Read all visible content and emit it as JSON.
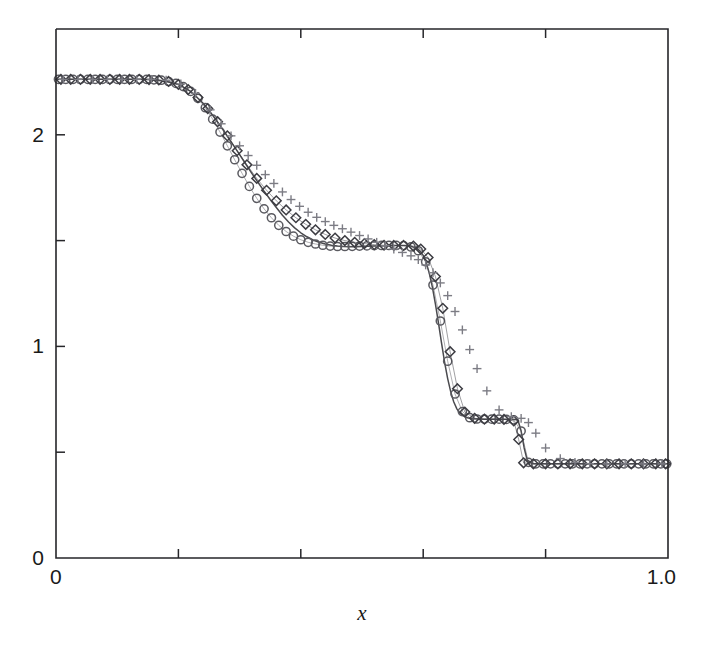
{
  "figure": {
    "background": "#ffffff",
    "width": 711,
    "height": 660
  },
  "axes": {
    "plot_box": {
      "left": 56,
      "right": 668,
      "top": 29,
      "bottom": 558
    },
    "xlabel": "x",
    "ylabel": "",
    "x_ticklabels": [
      {
        "value": 0.0,
        "text": "0"
      },
      {
        "value": 1.0,
        "text": "1.0"
      }
    ],
    "y_ticklabels": [
      {
        "value": 0,
        "text": "0"
      },
      {
        "value": 1,
        "text": "1"
      },
      {
        "value": 2,
        "text": "2"
      }
    ],
    "x_minor_ticks": [
      0.2,
      0.4,
      0.6,
      0.8
    ],
    "y_minor_ticks": [
      0.5,
      1.5
    ],
    "tick_direction": "in",
    "grid": false,
    "frame_color": "#26262a"
  },
  "chart_data": {
    "type": "line",
    "title": "",
    "subtitle": "",
    "xlabel": "x",
    "ylabel": "",
    "xlim": [
      0.0,
      1.0
    ],
    "ylim": [
      0.0,
      2.5
    ],
    "grid": false,
    "legend": "none",
    "annotations": [],
    "colors": {
      "reference_line": "#4a4a4e",
      "circle_marker": "#5a5a60",
      "diamond_marker": "#3c3c42",
      "plus_marker": "#7c7c84"
    },
    "series": [
      {
        "name": "exact-solution",
        "style": "solid-line",
        "marker": "none",
        "color": "#4a4a4e",
        "x": [
          0.0,
          0.02,
          0.04,
          0.06,
          0.08,
          0.1,
          0.12,
          0.14,
          0.16,
          0.18,
          0.2,
          0.22,
          0.24,
          0.25,
          0.26,
          0.27,
          0.28,
          0.29,
          0.3,
          0.31,
          0.32,
          0.33,
          0.34,
          0.35,
          0.36,
          0.37,
          0.38,
          0.39,
          0.4,
          0.41,
          0.42,
          0.43,
          0.44,
          0.45,
          0.46,
          0.47,
          0.48,
          0.49,
          0.5,
          0.51,
          0.52,
          0.53,
          0.54,
          0.55,
          0.56,
          0.57,
          0.58,
          0.59,
          0.595,
          0.6,
          0.605,
          0.61,
          0.615,
          0.62,
          0.625,
          0.63,
          0.635,
          0.64,
          0.645,
          0.65,
          0.655,
          0.66,
          0.67,
          0.68,
          0.7,
          0.72,
          0.735,
          0.745,
          0.75,
          0.755,
          0.76,
          0.765,
          0.77,
          0.78,
          0.8,
          0.84,
          0.88,
          0.92,
          0.96,
          1.0
        ],
        "y": [
          2.262,
          2.262,
          2.262,
          2.262,
          2.262,
          2.262,
          2.262,
          2.262,
          2.26,
          2.252,
          2.238,
          2.205,
          2.15,
          2.115,
          2.077,
          2.036,
          1.993,
          1.95,
          1.906,
          1.862,
          1.818,
          1.776,
          1.734,
          1.694,
          1.656,
          1.62,
          1.588,
          1.56,
          1.537,
          1.518,
          1.503,
          1.492,
          1.484,
          1.478,
          1.474,
          1.472,
          1.471,
          1.471,
          1.472,
          1.473,
          1.474,
          1.475,
          1.476,
          1.477,
          1.477,
          1.477,
          1.474,
          1.462,
          1.45,
          1.43,
          1.395,
          1.345,
          1.28,
          1.2,
          1.11,
          1.015,
          0.925,
          0.848,
          0.785,
          0.737,
          0.705,
          0.684,
          0.664,
          0.658,
          0.656,
          0.656,
          0.656,
          0.656,
          0.655,
          0.65,
          0.6,
          0.52,
          0.462,
          0.446,
          0.445,
          0.445,
          0.445,
          0.445,
          0.445,
          0.445
        ]
      },
      {
        "name": "scheme-A-circles",
        "style": "markers",
        "marker": "circle",
        "color": "#5a5a60",
        "x": [
          0.004,
          0.016,
          0.028,
          0.04,
          0.052,
          0.064,
          0.076,
          0.088,
          0.1,
          0.112,
          0.124,
          0.136,
          0.148,
          0.16,
          0.172,
          0.184,
          0.196,
          0.208,
          0.22,
          0.232,
          0.244,
          0.256,
          0.268,
          0.28,
          0.292,
          0.304,
          0.316,
          0.328,
          0.34,
          0.352,
          0.364,
          0.376,
          0.388,
          0.4,
          0.412,
          0.424,
          0.436,
          0.448,
          0.46,
          0.472,
          0.484,
          0.496,
          0.508,
          0.52,
          0.532,
          0.544,
          0.556,
          0.568,
          0.58,
          0.592,
          0.604,
          0.616,
          0.628,
          0.64,
          0.652,
          0.664,
          0.676,
          0.688,
          0.7,
          0.712,
          0.724,
          0.736,
          0.748,
          0.76,
          0.772,
          0.784,
          0.796,
          0.808,
          0.82,
          0.832,
          0.844,
          0.856,
          0.868,
          0.88,
          0.892,
          0.904,
          0.916,
          0.928,
          0.94,
          0.952,
          0.964,
          0.976,
          0.988,
          0.998
        ],
        "y": [
          2.262,
          2.262,
          2.262,
          2.262,
          2.262,
          2.262,
          2.262,
          2.262,
          2.262,
          2.262,
          2.262,
          2.262,
          2.262,
          2.26,
          2.258,
          2.252,
          2.243,
          2.228,
          2.205,
          2.172,
          2.128,
          2.074,
          2.013,
          1.948,
          1.882,
          1.818,
          1.756,
          1.7,
          1.65,
          1.608,
          1.572,
          1.543,
          1.521,
          1.504,
          1.492,
          1.484,
          1.478,
          1.474,
          1.472,
          1.472,
          1.473,
          1.474,
          1.475,
          1.476,
          1.477,
          1.477,
          1.477,
          1.476,
          1.47,
          1.452,
          1.4,
          1.29,
          1.12,
          0.93,
          0.775,
          0.692,
          0.663,
          0.657,
          0.656,
          0.656,
          0.656,
          0.655,
          0.653,
          0.6,
          0.452,
          0.445,
          0.445,
          0.445,
          0.445,
          0.445,
          0.445,
          0.445,
          0.445,
          0.445,
          0.445,
          0.445,
          0.445,
          0.445,
          0.445,
          0.445,
          0.445,
          0.445,
          0.445,
          0.445
        ]
      },
      {
        "name": "scheme-B-diamonds",
        "style": "markers",
        "marker": "diamond",
        "color": "#3c3c42",
        "x": [
          0.008,
          0.024,
          0.04,
          0.056,
          0.072,
          0.088,
          0.104,
          0.12,
          0.136,
          0.152,
          0.168,
          0.184,
          0.2,
          0.216,
          0.232,
          0.248,
          0.264,
          0.28,
          0.296,
          0.312,
          0.328,
          0.344,
          0.36,
          0.376,
          0.392,
          0.408,
          0.424,
          0.44,
          0.456,
          0.472,
          0.488,
          0.504,
          0.52,
          0.536,
          0.552,
          0.568,
          0.584,
          0.596,
          0.608,
          0.62,
          0.632,
          0.644,
          0.656,
          0.668,
          0.684,
          0.7,
          0.716,
          0.732,
          0.748,
          0.756,
          0.764,
          0.78,
          0.8,
          0.82,
          0.84,
          0.86,
          0.88,
          0.9,
          0.92,
          0.94,
          0.96,
          0.98,
          0.996
        ],
        "y": [
          2.262,
          2.262,
          2.262,
          2.262,
          2.262,
          2.262,
          2.262,
          2.262,
          2.262,
          2.261,
          2.259,
          2.252,
          2.238,
          2.214,
          2.176,
          2.124,
          2.062,
          1.995,
          1.925,
          1.858,
          1.794,
          1.738,
          1.688,
          1.645,
          1.608,
          1.577,
          1.551,
          1.529,
          1.512,
          1.5,
          1.492,
          1.486,
          1.481,
          1.478,
          1.477,
          1.477,
          1.474,
          1.46,
          1.42,
          1.33,
          1.18,
          0.975,
          0.8,
          0.69,
          0.66,
          0.656,
          0.656,
          0.655,
          0.648,
          0.56,
          0.45,
          0.445,
          0.445,
          0.445,
          0.445,
          0.445,
          0.445,
          0.445,
          0.445,
          0.445,
          0.445,
          0.445,
          0.445
        ]
      },
      {
        "name": "scheme-C-plus",
        "style": "markers",
        "marker": "plus",
        "color": "#7c7c84",
        "x": [
          0.012,
          0.036,
          0.06,
          0.084,
          0.108,
          0.132,
          0.156,
          0.18,
          0.204,
          0.228,
          0.252,
          0.27,
          0.286,
          0.3,
          0.314,
          0.328,
          0.342,
          0.356,
          0.37,
          0.384,
          0.398,
          0.412,
          0.426,
          0.44,
          0.454,
          0.468,
          0.482,
          0.496,
          0.51,
          0.524,
          0.538,
          0.552,
          0.566,
          0.58,
          0.592,
          0.604,
          0.616,
          0.628,
          0.64,
          0.652,
          0.664,
          0.676,
          0.688,
          0.704,
          0.724,
          0.744,
          0.76,
          0.772,
          0.784,
          0.8,
          0.824,
          0.848,
          0.872,
          0.9,
          0.93,
          0.96,
          0.99
        ],
        "y": [
          2.262,
          2.262,
          2.262,
          2.262,
          2.262,
          2.262,
          2.262,
          2.258,
          2.24,
          2.196,
          2.118,
          2.052,
          1.995,
          1.948,
          1.902,
          1.856,
          1.812,
          1.77,
          1.73,
          1.694,
          1.662,
          1.634,
          1.61,
          1.59,
          1.572,
          1.556,
          1.54,
          1.524,
          1.508,
          1.492,
          1.476,
          1.46,
          1.444,
          1.428,
          1.41,
          1.385,
          1.348,
          1.3,
          1.24,
          1.165,
          1.078,
          0.985,
          0.895,
          0.79,
          0.7,
          0.668,
          0.66,
          0.64,
          0.59,
          0.52,
          0.47,
          0.452,
          0.446,
          0.445,
          0.445,
          0.445,
          0.445
        ]
      }
    ]
  }
}
